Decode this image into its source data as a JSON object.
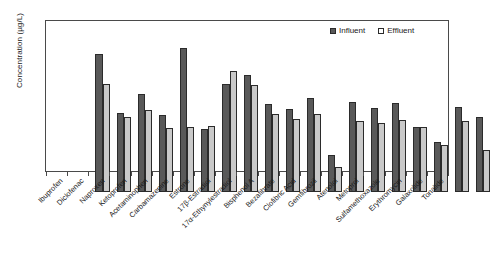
{
  "chart_data": {
    "type": "bar",
    "title": "",
    "xlabel": "",
    "ylabel": "Concentration (µg/L)",
    "yscale": "log",
    "ylim": [
      0.01,
      100
    ],
    "ytick_labels": [
      "100",
      "10",
      "1",
      "0.1",
      "0.01"
    ],
    "ytick_values": [
      100,
      10,
      1,
      0.1,
      0.01
    ],
    "grid": false,
    "legend_position": "top-right",
    "categories": [
      "Ibuprofen",
      "Diclofenac",
      "Naproxen",
      "Ketoprofen",
      "Acetaminophen",
      "Carbamazepine",
      "Estrone",
      "17β-Estradiol",
      "17α-Ethynylestradiol",
      "Bisphenol A",
      "Bezafibrate",
      "Clofibric Acid",
      "Gemfibrozil",
      "Atenolol",
      "Metoprol",
      "Sulfamethoxazole",
      "Erythromycin",
      "Galaxolide",
      "Tonalide"
    ],
    "series": [
      {
        "name": "Influent",
        "color": "#595959",
        "values": [
          47,
          1.3,
          4.1,
          1.1,
          71,
          0.48,
          7.8,
          13,
          2.2,
          1.6,
          3.2,
          0.095,
          2.5,
          1.75,
          2.4,
          0.55,
          0.21,
          1.8,
          0.98
        ]
      },
      {
        "name": "Effluent",
        "color": "#c9c9c9",
        "values": [
          7.4,
          0.99,
          1.55,
          0.52,
          0.55,
          0.58,
          17,
          7.0,
          1.2,
          0.9,
          1.2,
          0.047,
          0.77,
          0.68,
          0.85,
          0.55,
          0.18,
          0.77,
          0.13
        ]
      }
    ]
  },
  "legend": {
    "entries": [
      {
        "label": "Influent"
      },
      {
        "label": "Effluent"
      }
    ]
  }
}
